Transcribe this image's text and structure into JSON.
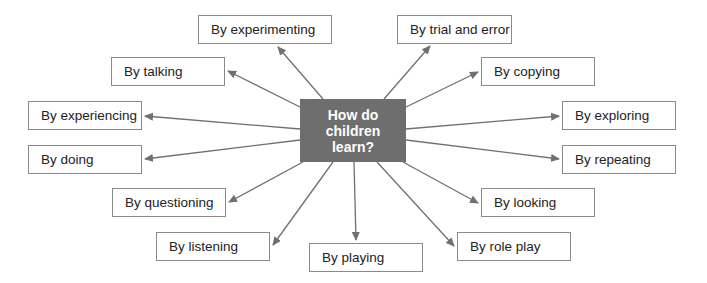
{
  "center": {
    "line1": "How do",
    "line2": "children",
    "line3": "learn?",
    "fill": "#6e6e6e"
  },
  "nodes": [
    {
      "id": "experimenting",
      "label": "By experimenting",
      "x": 198,
      "y": 15,
      "w": 134,
      "h": 29
    },
    {
      "id": "trial-and-error",
      "label": "By trial and error",
      "x": 397,
      "y": 15,
      "w": 115,
      "h": 29
    },
    {
      "id": "talking",
      "label": "By talking",
      "x": 111,
      "y": 57,
      "w": 114,
      "h": 29
    },
    {
      "id": "copying",
      "label": "By copying",
      "x": 481,
      "y": 57,
      "w": 114,
      "h": 29
    },
    {
      "id": "experiencing",
      "label": "By experiencing",
      "x": 28,
      "y": 101,
      "w": 114,
      "h": 29
    },
    {
      "id": "exploring",
      "label": "By exploring",
      "x": 562,
      "y": 101,
      "w": 114,
      "h": 29
    },
    {
      "id": "doing",
      "label": "By doing",
      "x": 28,
      "y": 145,
      "w": 114,
      "h": 29
    },
    {
      "id": "repeating",
      "label": "By repeating",
      "x": 562,
      "y": 145,
      "w": 114,
      "h": 29
    },
    {
      "id": "questioning",
      "label": "By questioning",
      "x": 112,
      "y": 188,
      "w": 114,
      "h": 29
    },
    {
      "id": "looking",
      "label": "By looking",
      "x": 481,
      "y": 188,
      "w": 114,
      "h": 29
    },
    {
      "id": "listening",
      "label": "By listening",
      "x": 156,
      "y": 232,
      "w": 114,
      "h": 29
    },
    {
      "id": "role-play",
      "label": "By role play",
      "x": 457,
      "y": 232,
      "w": 114,
      "h": 29
    },
    {
      "id": "playing",
      "label": "By playing",
      "x": 309,
      "y": 243,
      "w": 114,
      "h": 29
    }
  ],
  "arrows": [
    {
      "to": "experimenting",
      "x1": 323,
      "y1": 99,
      "x2": 278,
      "y2": 47
    },
    {
      "to": "trial-and-error",
      "x1": 384,
      "y1": 99,
      "x2": 430,
      "y2": 46
    },
    {
      "to": "talking",
      "x1": 300,
      "y1": 107,
      "x2": 228,
      "y2": 71
    },
    {
      "to": "copying",
      "x1": 406,
      "y1": 107,
      "x2": 478,
      "y2": 72
    },
    {
      "to": "experiencing",
      "x1": 300,
      "y1": 129,
      "x2": 145,
      "y2": 116
    },
    {
      "to": "exploring",
      "x1": 406,
      "y1": 129,
      "x2": 559,
      "y2": 116
    },
    {
      "to": "doing",
      "x1": 300,
      "y1": 140,
      "x2": 145,
      "y2": 159
    },
    {
      "to": "repeating",
      "x1": 406,
      "y1": 140,
      "x2": 559,
      "y2": 159
    },
    {
      "to": "questioning",
      "x1": 303,
      "y1": 162,
      "x2": 229,
      "y2": 202
    },
    {
      "to": "looking",
      "x1": 403,
      "y1": 162,
      "x2": 478,
      "y2": 203
    },
    {
      "to": "listening",
      "x1": 333,
      "y1": 162,
      "x2": 273,
      "y2": 245
    },
    {
      "to": "role-play",
      "x1": 377,
      "y1": 162,
      "x2": 454,
      "y2": 246
    },
    {
      "to": "playing",
      "x1": 354,
      "y1": 162,
      "x2": 356,
      "y2": 240
    }
  ],
  "colors": {
    "arrow": "#707070",
    "border": "#8a8a8a",
    "text": "#222222"
  }
}
